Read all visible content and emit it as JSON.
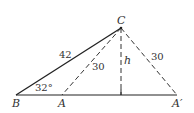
{
  "diagram": {
    "type": "geometry-triangle",
    "points": {
      "B": {
        "label": "B",
        "x": 16,
        "y": 95
      },
      "A": {
        "label": "A",
        "x": 62,
        "y": 95
      },
      "A_prime": {
        "label": "A′",
        "x": 177,
        "y": 95
      },
      "C": {
        "label": "C",
        "x": 121,
        "y": 28
      },
      "foot": {
        "x": 121,
        "y": 95
      }
    },
    "segments": {
      "BC": {
        "label": "42",
        "style": "solid"
      },
      "CA": {
        "label": "30",
        "style": "dashed"
      },
      "CA_prime": {
        "label": "30",
        "style": "dashed"
      },
      "height": {
        "label": "h",
        "style": "dashed"
      },
      "base": {
        "style": "solid"
      }
    },
    "angle_B": {
      "label": "32°"
    },
    "colors": {
      "stroke": "#222222",
      "text": "#333333"
    }
  }
}
